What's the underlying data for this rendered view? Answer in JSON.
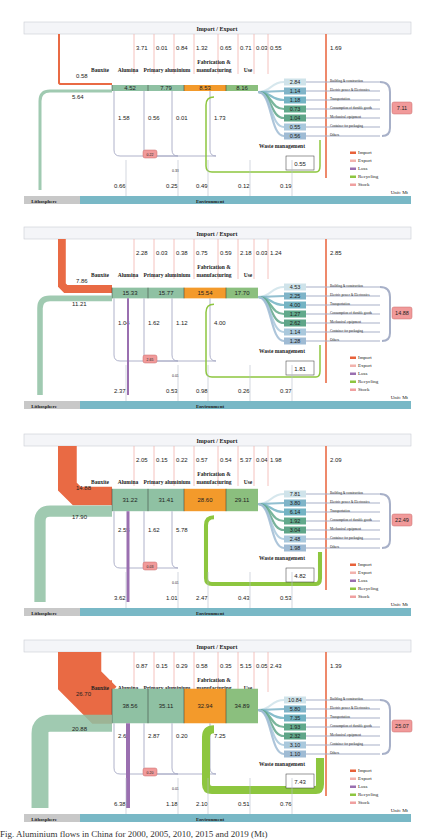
{
  "figure": {
    "caption": "Fig. Aluminium flows in China for 2000, 2005, 2010, 2015 and 2019 (Mt)",
    "labels": {
      "import_export": "Import / Export",
      "lithosphere": "Lithosphere",
      "environment": "Environment",
      "unit": "Unit: Mt",
      "waste_management": "Waste management",
      "stages": [
        "Bauxite",
        "Alumina",
        "Primary aluminium",
        "Fabrication &",
        "manufacturing",
        "Use"
      ],
      "end_uses": [
        "Building & construction",
        "Electric power & Electronics",
        "Transportation",
        "Consumption of durable goods",
        "Mechanical equipment",
        "Container for packaging",
        "Others"
      ]
    },
    "legend": [
      {
        "label": "Import",
        "color": "#e8623a"
      },
      {
        "label": "Export",
        "color": "#f2b3ad"
      },
      {
        "label": "Loss",
        "color": "#9a6fb0"
      },
      {
        "label": "Recycling",
        "color": "#8dc63f"
      },
      {
        "label": "Stock",
        "color": "#f0a0a0"
      }
    ],
    "colors": {
      "import": "#e8623a",
      "export": "#f2b3ad",
      "loss": "#9a6fb0",
      "recycling": "#8dc63f",
      "stock": "#f19a9a",
      "stage_green": "#8fc1a3",
      "fabrication": "#f39a2b",
      "use_green": "#8bbf7e",
      "environment": "#79b8c6",
      "lithosphere": "#c8c8c8",
      "enduse_gray": "#a7b0c8"
    }
  },
  "chart_data": [
    {
      "type": "sankey",
      "panel": 1,
      "import_top": [
        "3.71",
        "0.01",
        "0.84",
        "1.32",
        "0.65",
        "0.71",
        "0.03",
        "0.55",
        "1.69"
      ],
      "import_bauxite": "0.58",
      "stages": {
        "bauxite_to_alumina": "4.52",
        "primary": "7.79",
        "fabrication": "8.53",
        "use": "8.16"
      },
      "lithosphere": "5.64",
      "losses": [
        "1.58",
        "0.56",
        "0.01",
        "1.73"
      ],
      "stock_small": "0.22",
      "stock_flow": "0.33",
      "environment_flows": [
        "0.66",
        "0.25",
        "0.49",
        "0.12",
        "0.19"
      ],
      "waste": "0.55",
      "end_uses": [
        "2.84",
        "1.14",
        "1.18",
        "0.73",
        "1.04",
        "0.55",
        "0.56"
      ],
      "stock_total": "7.11"
    },
    {
      "type": "sankey",
      "panel": 2,
      "import_top": [
        "2.28",
        "0.03",
        "0.38",
        "0.75",
        "0.59",
        "2.18",
        "0.03",
        "1.24",
        "2.85"
      ],
      "import_bauxite": "7.86",
      "stages": {
        "bauxite_to_alumina": "15.33",
        "primary": "15.77",
        "fabrication": "15.54",
        "use": "17.70"
      },
      "lithosphere": "11.21",
      "losses": [
        "1.04",
        "1.62",
        "1.12",
        "4.00"
      ],
      "stock_small": "2.65",
      "stock_flow": "0.01",
      "environment_flows": [
        "2.37",
        "0.53",
        "0.98",
        "0.26",
        "0.37"
      ],
      "waste": "1.81",
      "end_uses": [
        "4.53",
        "2.25",
        "4.00",
        "1.27",
        "2.62",
        "1.14",
        "1.28"
      ],
      "stock_total": "14.88"
    },
    {
      "type": "sankey",
      "panel": 3,
      "import_top": [
        "2.05",
        "0.15",
        "0.22",
        "0.57",
        "0.54",
        "5.37",
        "0.04",
        "1.98",
        "2.09"
      ],
      "import_bauxite": "14.88",
      "stages": {
        "bauxite_to_alumina": "31.22",
        "primary": "31.41",
        "fabrication": "28.60",
        "use": "29.11"
      },
      "lithosphere": "17.90",
      "losses": [
        "2.55",
        "1.62",
        "5.78"
      ],
      "stock_small": "0.03",
      "stock_flow": "0.01",
      "environment_flows": [
        "3.62",
        "1.01",
        "2.47",
        "0.43",
        "0.53"
      ],
      "waste": "4.82",
      "end_uses": [
        "7.81",
        "3.80",
        "6.14",
        "1.92",
        "3.04",
        "2.48",
        "1.98"
      ],
      "stock_total": "22.49"
    },
    {
      "type": "sankey",
      "panel": 4,
      "import_top": [
        "0.87",
        "0.15",
        "0.29",
        "0.58",
        "0.35",
        "5.15",
        "0.05",
        "2.43",
        "1.39"
      ],
      "import_bauxite": "26.70",
      "stages": {
        "bauxite_to_alumina": "38.56",
        "primary": "35.11",
        "fabrication": "32.94",
        "use": "34.89"
      },
      "lithosphere": "20.88",
      "losses": [
        "2.64",
        "2.87",
        "0.20",
        "7.25"
      ],
      "stock_small": "0.20",
      "stock_flow": "0.01",
      "environment_flows": [
        "6.38",
        "1.18",
        "2.10",
        "0.51",
        "0.76"
      ],
      "waste": "7.43",
      "end_uses": [
        "10.84",
        "5.80",
        "7.35",
        "1.93",
        "2.32",
        "3.10",
        "1.10"
      ],
      "stock_total": "25.07"
    }
  ]
}
